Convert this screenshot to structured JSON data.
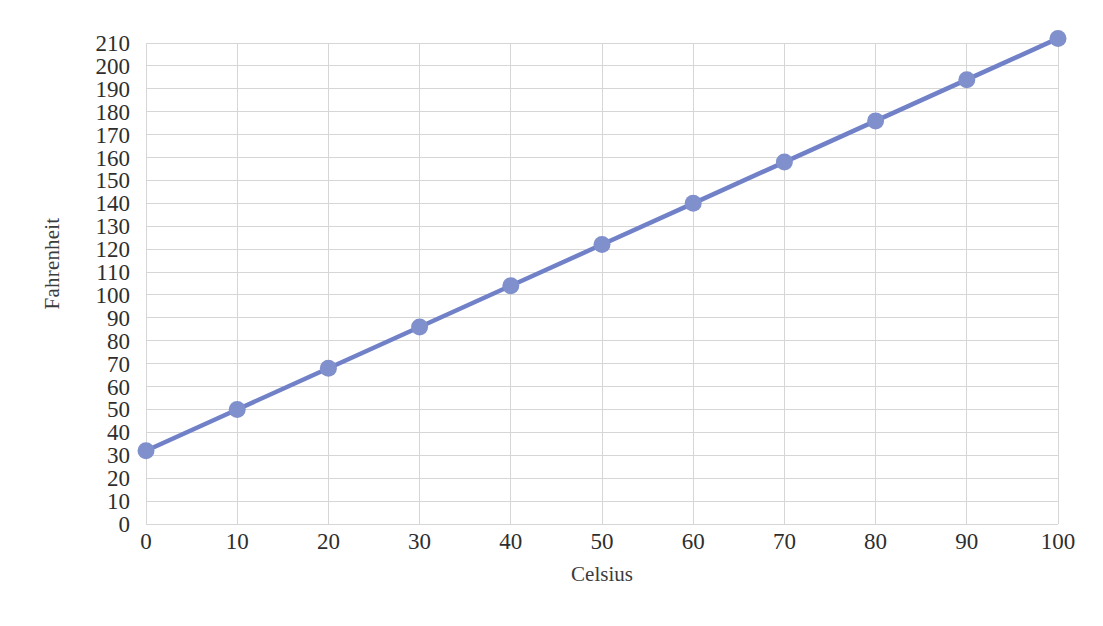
{
  "chart_data": {
    "type": "line",
    "title": "",
    "xlabel": "Celsius",
    "ylabel": "Fahrenheit",
    "x": [
      0,
      10,
      20,
      30,
      40,
      50,
      60,
      70,
      80,
      90,
      100
    ],
    "series": [
      {
        "name": "Fahrenheit",
        "values": [
          32,
          50,
          68,
          86,
          104,
          122,
          140,
          158,
          176,
          194,
          212
        ],
        "line_color": "#7181c8",
        "marker_color": "#8090cc",
        "marker_shape": "circle"
      }
    ],
    "xlim": [
      0,
      100
    ],
    "ylim": [
      0,
      210
    ],
    "xticks": [
      "0",
      "10",
      "20",
      "30",
      "40",
      "50",
      "60",
      "70",
      "80",
      "90",
      "100"
    ],
    "yticks": [
      "0",
      "10",
      "20",
      "30",
      "40",
      "50",
      "60",
      "70",
      "80",
      "90",
      "100",
      "110",
      "120",
      "130",
      "140",
      "150",
      "160",
      "170",
      "180",
      "190",
      "200",
      "210"
    ],
    "xtick_values": [
      0,
      10,
      20,
      30,
      40,
      50,
      60,
      70,
      80,
      90,
      100
    ],
    "ytick_values": [
      0,
      10,
      20,
      30,
      40,
      50,
      60,
      70,
      80,
      90,
      100,
      110,
      120,
      130,
      140,
      150,
      160,
      170,
      180,
      190,
      200,
      210
    ],
    "grid": {
      "horizontal": true,
      "vertical": true,
      "color": "#d6d6d6"
    },
    "legend": {
      "visible": false,
      "position": "none"
    },
    "background_color": "#ffffff"
  }
}
